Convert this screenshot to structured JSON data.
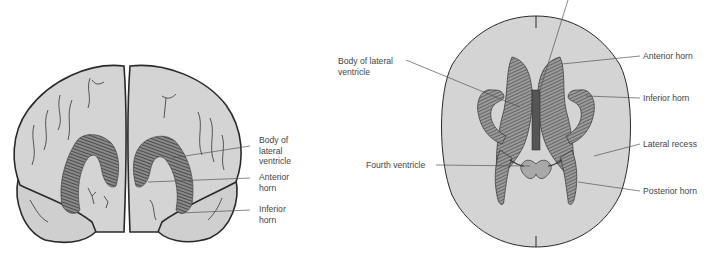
{
  "colors": {
    "background": "#ffffff",
    "brain_fill": "#d4d4d4",
    "outline": "#2a2a2a",
    "ventricle_fill": "#5a5a5a",
    "leader_line": "#555555",
    "label_text": "#444444"
  },
  "coronal_view": {
    "labels": [
      {
        "id": "body",
        "text": "Body of\nlateral\nventricle"
      },
      {
        "id": "anterior",
        "text": "Anterior\nhorn"
      },
      {
        "id": "inferior",
        "text": "Inferior\nhorn"
      }
    ]
  },
  "axial_view": {
    "labels": [
      {
        "id": "body",
        "text": "Body of lateral\nventricle"
      },
      {
        "id": "anterior",
        "text": "Anterior horn"
      },
      {
        "id": "inferior",
        "text": "Inferior horn"
      },
      {
        "id": "lateral_recess",
        "text": "Lateral recess"
      },
      {
        "id": "fourth",
        "text": "Fourth ventricle"
      },
      {
        "id": "posterior",
        "text": "Posterior horn"
      }
    ]
  }
}
